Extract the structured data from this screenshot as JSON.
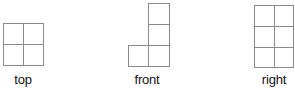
{
  "figure": {
    "title": "",
    "views": [
      {
        "id": "top",
        "label": "top",
        "grid": {
          "cols": 2,
          "rows": 2
        },
        "cells": [
          [
            0,
            0
          ],
          [
            1,
            0
          ],
          [
            0,
            1
          ],
          [
            1,
            1
          ]
        ]
      },
      {
        "id": "front",
        "label": "front",
        "grid": {
          "cols": 2,
          "rows": 3
        },
        "cells": [
          [
            1,
            0
          ],
          [
            1,
            1
          ],
          [
            0,
            2
          ],
          [
            1,
            2
          ]
        ]
      },
      {
        "id": "right",
        "label": "right",
        "grid": {
          "cols": 2,
          "rows": 3
        },
        "cells": [
          [
            0,
            0
          ],
          [
            1,
            0
          ],
          [
            0,
            1
          ],
          [
            1,
            1
          ],
          [
            0,
            2
          ],
          [
            1,
            2
          ]
        ]
      }
    ],
    "line_color": "#8a8a8a"
  }
}
